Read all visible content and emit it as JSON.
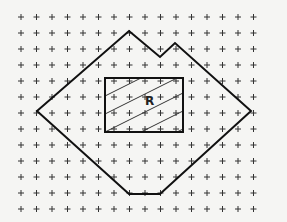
{
  "grid": {
    "x0": 21,
    "y0": 17,
    "dx": 15.5,
    "dy": 16,
    "cols": 16,
    "rows": 13,
    "color": "#333333"
  },
  "polygon": [
    [
      129,
      31
    ],
    [
      160,
      57
    ],
    [
      175,
      43
    ],
    [
      251,
      111
    ],
    [
      160,
      194
    ],
    [
      129,
      194
    ],
    [
      37,
      111
    ]
  ],
  "rectangle": {
    "x": 105,
    "y": 78,
    "w": 78,
    "h": 54
  },
  "region_label": "R"
}
